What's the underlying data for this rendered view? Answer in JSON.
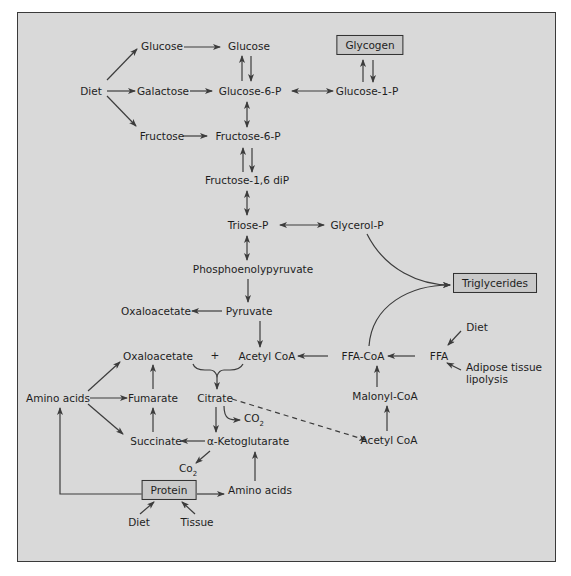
{
  "diagram": {
    "colors": {
      "background": "#d9d9d9",
      "frame": "#3a3a3a",
      "box_fill": "#c9c9c9",
      "text": "#1e1e1e",
      "arrow": "#3c3c3c"
    },
    "nodes": {
      "diet_carb": "Diet",
      "glucose_diet": "Glucose",
      "galactose": "Galactose",
      "fructose": "Fructose",
      "glucose": "Glucose",
      "glucose_6_p": "Glucose-6-P",
      "glucose_1_p": "Glucose-1-P",
      "glycogen": "Glycogen",
      "fructose_6_p": "Fructose-6-P",
      "fructose_1_6_dip": "Fructose-1,6 diP",
      "triose_p": "Triose-P",
      "glycerol_p": "Glycerol-P",
      "phosphoenolpyruvate": "Phosphoenolypyruvate",
      "triglycerides": "Triglycerides",
      "oxaloacetate_1": "Oxaloacetate",
      "pyruvate": "Pyruvate",
      "oxaloacetate_2": "Oxaloacetate",
      "plus": "+",
      "acetyl_coa_1": "Acetyl CoA",
      "ffa_coa": "FFA-CoA",
      "ffa": "FFA",
      "diet_fat": "Diet",
      "adipose_lipolysis": "Adipose tissue\nlipolysis",
      "amino_acids_1": "Amino acids",
      "fumarate": "Fumarate",
      "citrate": "Citrate",
      "co2_1": "CO",
      "co2_1_sub": "2",
      "malonyl_coa": "Malonyl-CoA",
      "succinate": "Succinate",
      "alpha_ketoglutarate": "α-Ketoglutarate",
      "acetyl_coa_2": "Acetyl CoA",
      "co2_2": "Co",
      "co2_2_sub": "2",
      "protein": "Protein",
      "amino_acids_2": "Amino acids",
      "diet_protein": "Diet",
      "tissue": "Tissue"
    },
    "edges": [
      {
        "from": "Diet",
        "to": "Glucose",
        "type": "forward"
      },
      {
        "from": "Diet",
        "to": "Galactose",
        "type": "forward"
      },
      {
        "from": "Diet",
        "to": "Fructose",
        "type": "forward"
      },
      {
        "from": "Glucose",
        "to": "Glucose",
        "type": "forward"
      },
      {
        "from": "Galactose",
        "to": "Glucose-6-P",
        "type": "forward"
      },
      {
        "from": "Fructose",
        "to": "Fructose-6-P",
        "type": "forward"
      },
      {
        "from": "Glucose",
        "to": "Glucose-6-P",
        "type": "paired"
      },
      {
        "from": "Glucose-6-P",
        "to": "Glucose-1-P",
        "type": "bidirectional"
      },
      {
        "from": "Glucose-1-P",
        "to": "Glycogen",
        "type": "paired"
      },
      {
        "from": "Glucose-6-P",
        "to": "Fructose-6-P",
        "type": "bidirectional"
      },
      {
        "from": "Fructose-6-P",
        "to": "Fructose-1,6 diP",
        "type": "paired"
      },
      {
        "from": "Fructose-1,6 diP",
        "to": "Triose-P",
        "type": "bidirectional"
      },
      {
        "from": "Triose-P",
        "to": "Glycerol-P",
        "type": "bidirectional"
      },
      {
        "from": "Triose-P",
        "to": "Phosphoenolypyruvate",
        "type": "bidirectional"
      },
      {
        "from": "Phosphoenolypyruvate",
        "to": "Pyruvate",
        "type": "forward"
      },
      {
        "from": "Pyruvate",
        "to": "Oxaloacetate",
        "type": "forward"
      },
      {
        "from": "Pyruvate",
        "to": "Acetyl CoA",
        "type": "forward"
      },
      {
        "from": "Glycerol-P",
        "to": "Triglycerides",
        "type": "forward"
      },
      {
        "from": "FFA-CoA",
        "to": "Triglycerides",
        "type": "forward"
      },
      {
        "from": "FFA-CoA",
        "to": "Acetyl CoA",
        "type": "forward"
      },
      {
        "from": "FFA",
        "to": "FFA-CoA",
        "type": "forward"
      },
      {
        "from": "Diet",
        "to": "FFA",
        "type": "forward"
      },
      {
        "from": "Adipose tissue lipolysis",
        "to": "FFA",
        "type": "forward"
      },
      {
        "from": "Malonyl-CoA",
        "to": "FFA-CoA",
        "type": "forward"
      },
      {
        "from": "Acetyl CoA",
        "to": "Malonyl-CoA",
        "type": "forward"
      },
      {
        "from": "Oxaloacetate + Acetyl CoA",
        "to": "Citrate",
        "type": "forward"
      },
      {
        "from": "Citrate",
        "to": "CO2",
        "type": "forward"
      },
      {
        "from": "Citrate",
        "to": "Acetyl CoA",
        "type": "dashed"
      },
      {
        "from": "Citrate",
        "to": "α-Ketoglutarate",
        "type": "forward"
      },
      {
        "from": "α-Ketoglutarate",
        "to": "Succinate",
        "type": "forward"
      },
      {
        "from": "α-Ketoglutarate",
        "to": "Co2",
        "type": "forward"
      },
      {
        "from": "Succinate",
        "to": "Fumarate",
        "type": "forward"
      },
      {
        "from": "Fumarate",
        "to": "Oxaloacetate",
        "type": "forward"
      },
      {
        "from": "Amino acids",
        "to": "Oxaloacetate",
        "type": "forward"
      },
      {
        "from": "Amino acids",
        "to": "Fumarate",
        "type": "forward"
      },
      {
        "from": "Amino acids",
        "to": "Succinate",
        "type": "forward"
      },
      {
        "from": "Protein",
        "to": "Amino acids",
        "type": "forward"
      },
      {
        "from": "Protein",
        "to": "Amino acids (left)",
        "type": "forward"
      },
      {
        "from": "Amino acids",
        "to": "α-Ketoglutarate",
        "type": "forward"
      },
      {
        "from": "Diet",
        "to": "Protein",
        "type": "forward"
      },
      {
        "from": "Tissue",
        "to": "Protein",
        "type": "forward"
      }
    ]
  }
}
